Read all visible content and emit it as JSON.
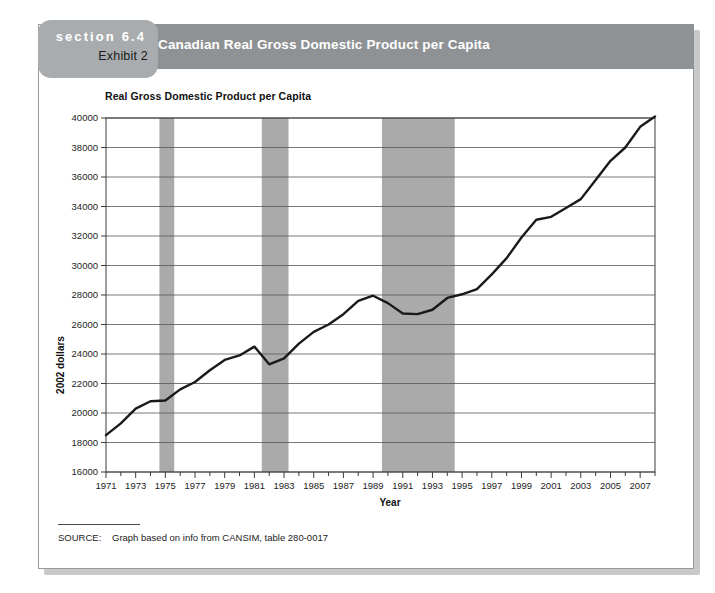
{
  "exhibit": {
    "section_label": "section 6.4",
    "exhibit_label": "Exhibit 2",
    "banner_title": "Canadian Real Gross Domestic Product per Capita",
    "source_label": "SOURCE:",
    "source_text": "Graph based on info from CANSIM, table 280-0017"
  },
  "colors": {
    "banner": "#8f9294",
    "tab": "#a9acae",
    "recession_band": "#aaaaaa",
    "line": "#1a1a1a",
    "gridline": "#555555",
    "card_border": "#9a9a9a"
  },
  "chart_data": {
    "type": "line",
    "title": "Real Gross Domestic Product per Capita",
    "xlabel": "Year",
    "ylabel": "2002 dollars",
    "xlim": [
      1971,
      2008
    ],
    "ylim": [
      16000,
      40000
    ],
    "ytick_step": 2000,
    "yticks": [
      16000,
      18000,
      20000,
      22000,
      24000,
      26000,
      28000,
      30000,
      32000,
      34000,
      36000,
      38000,
      40000
    ],
    "xticks": [
      1971,
      1972,
      1973,
      1974,
      1975,
      1976,
      1977,
      1978,
      1979,
      1980,
      1981,
      1982,
      1983,
      1984,
      1985,
      1986,
      1987,
      1988,
      1989,
      1990,
      1991,
      1992,
      1993,
      1994,
      1995,
      1996,
      1997,
      1998,
      1999,
      2000,
      2001,
      2002,
      2003,
      2004,
      2005,
      2006,
      2007,
      2008
    ],
    "xtick_labels": [
      1971,
      1973,
      1975,
      1977,
      1979,
      1981,
      1983,
      1985,
      1987,
      1989,
      1991,
      1993,
      1995,
      1997,
      1999,
      2001,
      2003,
      2005,
      2007
    ],
    "grid": true,
    "legend": false,
    "x": [
      1971,
      1972,
      1973,
      1974,
      1975,
      1976,
      1977,
      1978,
      1979,
      1980,
      1981,
      1982,
      1983,
      1984,
      1985,
      1986,
      1987,
      1988,
      1989,
      1990,
      1991,
      1992,
      1993,
      1994,
      1995,
      1996,
      1997,
      1998,
      1999,
      2000,
      2001,
      2002,
      2003,
      2004,
      2005,
      2006,
      2007,
      2008
    ],
    "values": [
      18500,
      19300,
      20300,
      20800,
      20850,
      21600,
      22100,
      22900,
      23600,
      23900,
      24500,
      23300,
      23700,
      24700,
      25500,
      26000,
      26700,
      27600,
      27950,
      27450,
      26750,
      26700,
      27000,
      27800,
      28050,
      28400,
      29400,
      30500,
      31900,
      33100,
      33300,
      33900,
      34500,
      35800,
      37100,
      38000,
      39400,
      40100
    ],
    "recession_bands": [
      {
        "start": 1974.6,
        "end": 1975.6,
        "label": "recession-band-1975"
      },
      {
        "start": 1981.5,
        "end": 1983.3,
        "label": "recession-band-1982"
      },
      {
        "start": 1989.6,
        "end": 1994.5,
        "label": "recession-band-1991"
      }
    ]
  }
}
